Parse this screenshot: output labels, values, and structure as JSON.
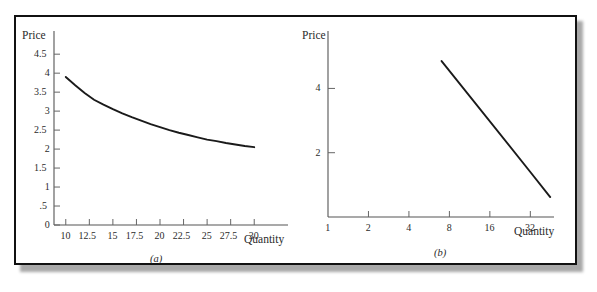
{
  "figure": {
    "caption_a": "(a)",
    "caption_b": "(b)",
    "border_color": "#111111",
    "curve_color": "#1a1a1a",
    "axis_color": "#555555"
  },
  "chart_data": [
    {
      "type": "line",
      "title": "",
      "panel": "(a)",
      "xlabel": "Quantity",
      "ylabel": "Price",
      "grid": false,
      "legend": "none",
      "xlim": [
        8.75,
        31.25
      ],
      "ylim": [
        0,
        4.9
      ],
      "xticks": [
        "10",
        "12.5",
        "15",
        "17.5",
        "20",
        "22.5",
        "25",
        "27.5",
        "30"
      ],
      "xtick_values": [
        10,
        12.5,
        15,
        17.5,
        20,
        22.5,
        25,
        27.5,
        30
      ],
      "yticks": [
        "4.5",
        "4",
        "3.5",
        "3",
        "2.5",
        "2",
        "1.5",
        "1",
        ".5",
        "0"
      ],
      "ytick_values": [
        4.5,
        4,
        3.5,
        3,
        2.5,
        2,
        1.5,
        1,
        0.5,
        0
      ],
      "x": [
        10,
        11,
        12,
        13,
        14,
        15,
        16,
        17,
        18,
        19,
        20,
        21,
        22,
        23,
        24,
        25,
        26,
        27,
        28,
        29,
        30
      ],
      "values": [
        3.9,
        3.68,
        3.48,
        3.3,
        3.17,
        3.05,
        2.94,
        2.84,
        2.75,
        2.66,
        2.58,
        2.5,
        2.43,
        2.37,
        2.31,
        2.25,
        2.21,
        2.16,
        2.12,
        2.08,
        2.05
      ],
      "series_name": "demand-curve",
      "axis_scale_x": "linear",
      "axis_scale_y": "linear"
    },
    {
      "type": "line",
      "title": "",
      "panel": "(b)",
      "xlabel": "Quantity",
      "ylabel": "Price",
      "grid": false,
      "legend": "none",
      "xlim": [
        1,
        48
      ],
      "ylim": [
        0,
        5.6
      ],
      "xticks": [
        "1",
        "2",
        "4",
        "8",
        "16",
        "32"
      ],
      "xtick_values": [
        1,
        2,
        4,
        8,
        16,
        32
      ],
      "yticks": [
        "4",
        "2"
      ],
      "ytick_values": [
        4,
        2
      ],
      "x": [
        7,
        32,
        45
      ],
      "values": [
        4.85,
        1.4,
        0.62
      ],
      "series_name": "log-demand-line",
      "axis_scale_x": "log2",
      "axis_scale_y": "linear"
    }
  ],
  "panel_a": {
    "ylabel": "Price",
    "xlabel": "Quantity",
    "caption": "(a)",
    "xticks": [
      "10",
      "12.5",
      "15",
      "17.5",
      "20",
      "22.5",
      "25",
      "27.5",
      "30"
    ],
    "yticks": [
      "4.5",
      "4",
      "3.5",
      "3",
      "2.5",
      "2",
      "1.5",
      "1",
      ".5",
      "0"
    ]
  },
  "panel_b": {
    "ylabel": "Price",
    "xlabel": "Quantity",
    "caption": "(b)",
    "xticks": [
      "1",
      "2",
      "4",
      "8",
      "16",
      "32"
    ],
    "yticks": [
      "4",
      "2"
    ]
  }
}
